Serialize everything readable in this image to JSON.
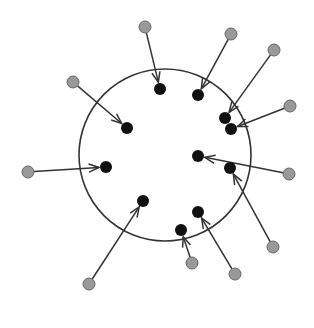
{
  "diagram": {
    "type": "point-displacement",
    "circle": {
      "cx": 165,
      "cy": 155,
      "r": 86,
      "stroke": "#333333"
    },
    "colors": {
      "source": "#999999",
      "source_stroke": "#666666",
      "target": "#111111",
      "arrow": "#333333"
    },
    "arrows": [
      {
        "from": [
          145,
          27
        ],
        "to": [
          160,
          89
        ]
      },
      {
        "from": [
          231,
          34
        ],
        "to": [
          198,
          95
        ]
      },
      {
        "from": [
          274,
          50
        ],
        "to": [
          225,
          118
        ]
      },
      {
        "from": [
          290,
          106
        ],
        "to": [
          231,
          129
        ]
      },
      {
        "from": [
          73,
          82
        ],
        "to": [
          127,
          128
        ]
      },
      {
        "from": [
          289,
          174
        ],
        "to": [
          198,
          156
        ]
      },
      {
        "from": [
          273,
          247
        ],
        "to": [
          230,
          168
        ]
      },
      {
        "from": [
          28,
          172
        ],
        "to": [
          106,
          167
        ]
      },
      {
        "from": [
          89,
          284
        ],
        "to": [
          143,
          201
        ]
      },
      {
        "from": [
          235,
          274
        ],
        "to": [
          198,
          212
        ]
      },
      {
        "from": [
          192,
          263
        ],
        "to": [
          181,
          230
        ]
      }
    ]
  }
}
